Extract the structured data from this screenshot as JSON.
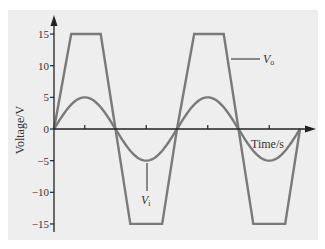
{
  "chart_data": {
    "type": "line",
    "title": "",
    "xlabel": "Time/s",
    "ylabel": "Voltage/V",
    "ylim": [
      -15,
      15
    ],
    "yticks": [
      15,
      10,
      5,
      0,
      -5,
      -10,
      -15
    ],
    "ytick_labels": [
      "15",
      "10",
      "5",
      "0",
      "−5",
      "−10",
      "−15"
    ],
    "xticks_count": 4,
    "grid": false,
    "legend": "inline annotations",
    "period_units": 1,
    "x": [
      0,
      0.14,
      0.38,
      0.5,
      0.62,
      0.88,
      1.0,
      1.14,
      1.38,
      1.5,
      1.62,
      1.88,
      2.0
    ],
    "series": [
      {
        "name": "V_o",
        "label_main": "V",
        "label_sub": "o",
        "kind": "clipped-trapezoid",
        "values": [
          0,
          15,
          15,
          0,
          -15,
          -15,
          0,
          15,
          15,
          0,
          -15,
          -15,
          0
        ],
        "color": "#7a7a7a"
      },
      {
        "name": "V_i",
        "label_main": "V",
        "label_sub": "i",
        "kind": "sine",
        "amplitude": 5,
        "periods": 2,
        "color": "#7a7a7a"
      }
    ]
  },
  "colors": {
    "panel_bg": "#eeeeee",
    "axis": "#222222",
    "curve": "#7a7a7a"
  }
}
